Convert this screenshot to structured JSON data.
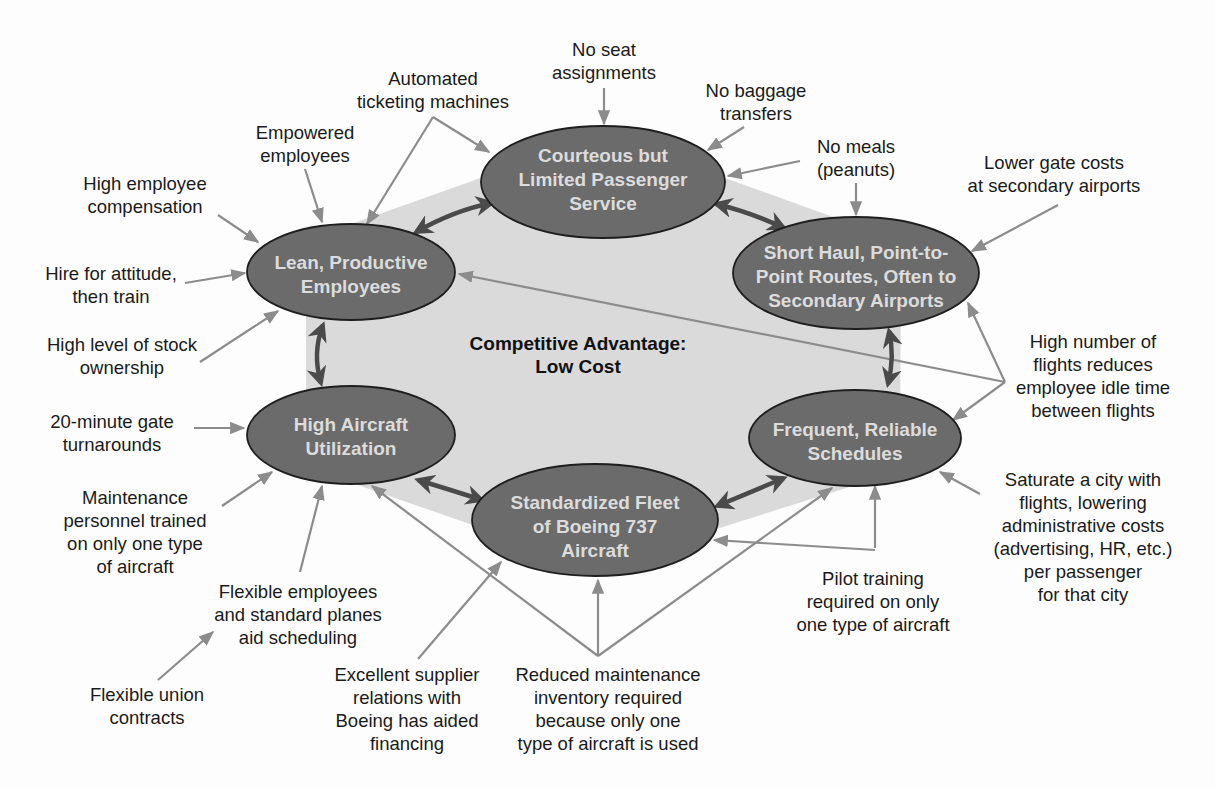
{
  "colors": {
    "node_fill": "#6b6b6b",
    "node_stroke": "#1e1e1e",
    "node_text": "#dcdcdc",
    "center_fill": "#dadada",
    "connector": "#8c8c8c",
    "double_arrow": "#4a4a4a",
    "label_text": "#1a1a1a"
  },
  "center": {
    "line1": "Competitive Advantage:",
    "line2": "Low Cost"
  },
  "nodes": {
    "service": {
      "line1": "Courteous but",
      "line2": "Limited Passenger",
      "line3": "Service"
    },
    "routes": {
      "line1": "Short Haul, Point-to-",
      "line2": "Point Routes, Often to",
      "line3": "Secondary Airports"
    },
    "schedules": {
      "line1": "Frequent, Reliable",
      "line2": "Schedules"
    },
    "fleet": {
      "line1": "Standardized Fleet",
      "line2": "of Boeing 737",
      "line3": "Aircraft"
    },
    "utilization": {
      "line1": "High Aircraft",
      "line2": "Utilization"
    },
    "employees": {
      "line1": "Lean, Productive",
      "line2": "Employees"
    }
  },
  "labels": {
    "no_seat": [
      "No seat",
      "assignments"
    ],
    "automated": [
      "Automated",
      "ticketing machines"
    ],
    "no_baggage": [
      "No baggage",
      "transfers"
    ],
    "empowered": [
      "Empowered",
      "employees"
    ],
    "no_meals": [
      "No meals",
      "(peanuts)"
    ],
    "lower_gate": [
      "Lower gate costs",
      "at secondary airports"
    ],
    "compensation": [
      "High employee",
      "compensation"
    ],
    "hire": [
      "Hire for attitude,",
      "then train"
    ],
    "stock": [
      "High level of stock",
      "ownership"
    ],
    "high_flights": [
      "High number of",
      "flights reduces",
      "employee idle time",
      "between flights"
    ],
    "gate_turn": [
      "20-minute gate",
      "turnarounds"
    ],
    "saturate": [
      "Saturate a city with",
      "flights, lowering",
      "administrative costs",
      "(advertising, HR, etc.)",
      "per passenger",
      "for that city"
    ],
    "maint_personnel": [
      "Maintenance",
      "personnel trained",
      "on only one type",
      "of aircraft"
    ],
    "flex_employees": [
      "Flexible employees",
      "and standard planes",
      "aid scheduling"
    ],
    "pilot": [
      "Pilot training",
      "required on only",
      "one type of aircraft"
    ],
    "flex_union": [
      "Flexible union",
      "contracts"
    ],
    "supplier": [
      "Excellent supplier",
      "relations with",
      "Boeing has aided",
      "financing"
    ],
    "reduced_maint": [
      "Reduced maintenance",
      "inventory required",
      "because only one",
      "type of aircraft is used"
    ]
  }
}
